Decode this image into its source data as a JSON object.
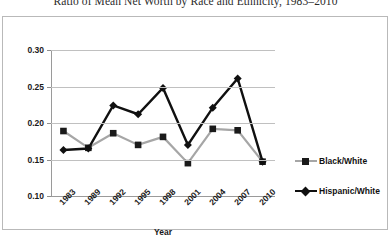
{
  "chart_data": {
    "type": "line",
    "title": "Ratio of Mean Net Worth by Race and Ethnicity, 1983–2010",
    "xlabel": "Year",
    "ylabel": "",
    "categories": [
      "1983",
      "1989",
      "1992",
      "1995",
      "1998",
      "2001",
      "2004",
      "2007",
      "2010"
    ],
    "ylim": [
      0.1,
      0.3
    ],
    "yticks": [
      "0.30",
      "0.25",
      "0.20",
      "0.15",
      "0.10"
    ],
    "ytick_values": [
      0.3,
      0.25,
      0.2,
      0.15,
      0.1
    ],
    "grid": true,
    "legend_position": "right",
    "series": [
      {
        "name": "Black/White",
        "color": "#a6a6a6",
        "marker": "square",
        "marker_color": "#1a1a1a",
        "values": [
          0.189,
          0.166,
          0.186,
          0.17,
          0.181,
          0.145,
          0.192,
          0.19,
          0.147
        ]
      },
      {
        "name": "Hispanic/White",
        "color": "#101010",
        "marker": "diamond",
        "marker_color": "#101010",
        "values": [
          0.163,
          0.165,
          0.224,
          0.212,
          0.248,
          0.17,
          0.221,
          0.261,
          0.147
        ]
      }
    ]
  },
  "colors": {
    "frame": "#b9b9b9",
    "gridline": "#c0c0c0",
    "axis": "#9a9a9a",
    "text": "#1a1a1a"
  }
}
